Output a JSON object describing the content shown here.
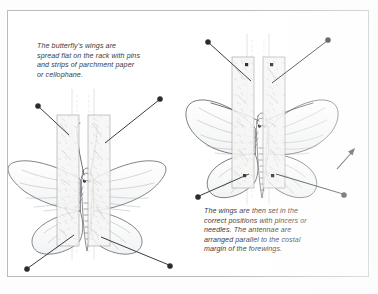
{
  "figure": {
    "panels": [
      {
        "id": "panel-left",
        "stage": 1,
        "caption": "The butterfly's wings are\nspread flat on the rack with pins\nand strips of parchment paper\nor cellophane.",
        "subject": "butterfly-spread-flat",
        "antennae": "raised-upright",
        "paper_strips": 2,
        "pins": 4,
        "pin_positions": [
          "top-left",
          "top-right",
          "bottom-left",
          "bottom-right"
        ]
      },
      {
        "id": "panel-right",
        "stage": 2,
        "caption": "The wings are then set in the\ncorrect positions with pincers or\nneedles. The antennae are\narranged parallel to the costal\nmargin of the forewings.",
        "subject": "butterfly-wings-set",
        "antennae": "parallel-to-costal-margin",
        "paper_strips": 2,
        "pins": 4,
        "pin_positions": [
          "top-left",
          "top-right",
          "bottom-left",
          "bottom-right"
        ],
        "annotation_arrow": "up-right"
      }
    ]
  },
  "colors": {
    "page_background": "#fdfdfd",
    "frame_border": "#b9bcbe",
    "ink": "#3a3a3c",
    "line_art": "#5a5d61",
    "pin_head": "#2b2b2d",
    "paper_strip_fill": "#f4f5f3",
    "paper_strip_stroke": "#9aa0a4"
  }
}
